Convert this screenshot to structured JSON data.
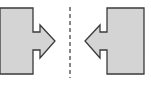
{
  "diagram": {
    "colors": {
      "fill": "#d4d4d4",
      "stroke": "#3a3a3a",
      "divider": "#555555",
      "background": "#ffffff"
    },
    "left_shape": {
      "direction": "right",
      "points": "0,8 33,8 33,32 40,32 40,25 55,41 40,58 40,50 33,50 33,74 0,74"
    },
    "right_shape": {
      "direction": "left",
      "points": "107,8 144,8 144,74 107,74 107,50 100,50 100,58 85,41 100,25 100,32 107,32"
    },
    "divider": {
      "x": 70,
      "y1": 7,
      "y2": 78,
      "dash": "4,3"
    }
  }
}
